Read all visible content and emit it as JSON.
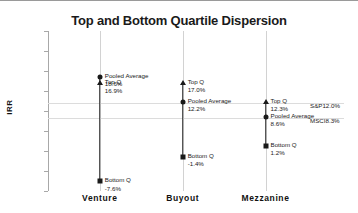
{
  "chart_data": {
    "type": "scatter",
    "title": "Top and Bottom Quartile Dispersion",
    "xlabel": "",
    "ylabel": "IRR",
    "ylim": [
      -10,
      30
    ],
    "ytick_labels": [
      "30%",
      "25%",
      "20%",
      "15%",
      "10%",
      "5%",
      "0%",
      "-5%",
      "-10%"
    ],
    "ytick_values": [
      30,
      25,
      20,
      15,
      10,
      5,
      0,
      -5,
      -10
    ],
    "grid": true,
    "legend_position": "none",
    "categories": [
      "Venture",
      "Buyout",
      "Mezzanine"
    ],
    "series": [
      {
        "name": "Pooled Average",
        "values": [
          18.6,
          12.2,
          8.6
        ]
      },
      {
        "name": "Top Q",
        "values": [
          16.9,
          17.0,
          12.3
        ]
      },
      {
        "name": "Bottom Q",
        "values": [
          -7.6,
          -1.4,
          1.2
        ]
      }
    ],
    "points": [
      {
        "category": "Venture",
        "label": "Pooled Average",
        "value": 18.6,
        "value_text": "18.6%",
        "marker": "circle"
      },
      {
        "category": "Venture",
        "label": "Top Q",
        "value": 16.9,
        "value_text": "16.9%",
        "marker": "tri"
      },
      {
        "category": "Venture",
        "label": "Bottom Q",
        "value": -7.6,
        "value_text": "-7.6%",
        "marker": "square"
      },
      {
        "category": "Buyout",
        "label": "Top Q",
        "value": 17.0,
        "value_text": "17.0%",
        "marker": "tri"
      },
      {
        "category": "Buyout",
        "label": "Pooled Average",
        "value": 12.2,
        "value_text": "12.2%",
        "marker": "circle"
      },
      {
        "category": "Buyout",
        "label": "Bottom Q",
        "value": -1.4,
        "value_text": "-1.4%",
        "marker": "square"
      },
      {
        "category": "Mezzanine",
        "label": "Top Q",
        "value": 12.3,
        "value_text": "12.3%",
        "marker": "tri"
      },
      {
        "category": "Mezzanine",
        "label": "Pooled Average",
        "value": 8.6,
        "value_text": "8.6%",
        "marker": "circle"
      },
      {
        "category": "Mezzanine",
        "label": "Bottom Q",
        "value": 1.2,
        "value_text": "1.2%",
        "marker": "square"
      }
    ],
    "reference_lines": [
      {
        "name": "S&P",
        "value": 12.0,
        "value_text": "12.0%"
      },
      {
        "name": "MSCI",
        "value": 8.3,
        "value_text": "8.3%"
      }
    ],
    "annotations": {
      "venture": {
        "pooled_label": "Pooled Average",
        "pooled_value": "18.6%",
        "top_label": "Top Q",
        "top_value": "16.9%",
        "bottom_label": "Bottom Q",
        "bottom_value": "-7.6%"
      },
      "buyout": {
        "top_label": "Top Q",
        "top_value": "17.0%",
        "pooled_label": "Pooled Average",
        "pooled_value": "12.2%",
        "bottom_label": "Bottom Q",
        "bottom_value": "-1.4%"
      },
      "mezzanine": {
        "top_label": "Top Q",
        "top_value": "12.3%",
        "pooled_label": "Pooled Average",
        "pooled_value": "8.6%",
        "bottom_label": "Bottom Q",
        "bottom_value": "1.2%"
      },
      "benchmarks": {
        "sp_label": "S&P",
        "sp_value": "12.0%",
        "msci_label": "MSCI",
        "msci_value": "8.3%"
      }
    },
    "colors": {
      "marker": "#1a1a1a",
      "bar": "#2b2b2b",
      "gridline": "#d2d2d2",
      "refline": "#dcdcdc",
      "axis": "#a8a8a8",
      "text": "#1a1a1a"
    }
  }
}
